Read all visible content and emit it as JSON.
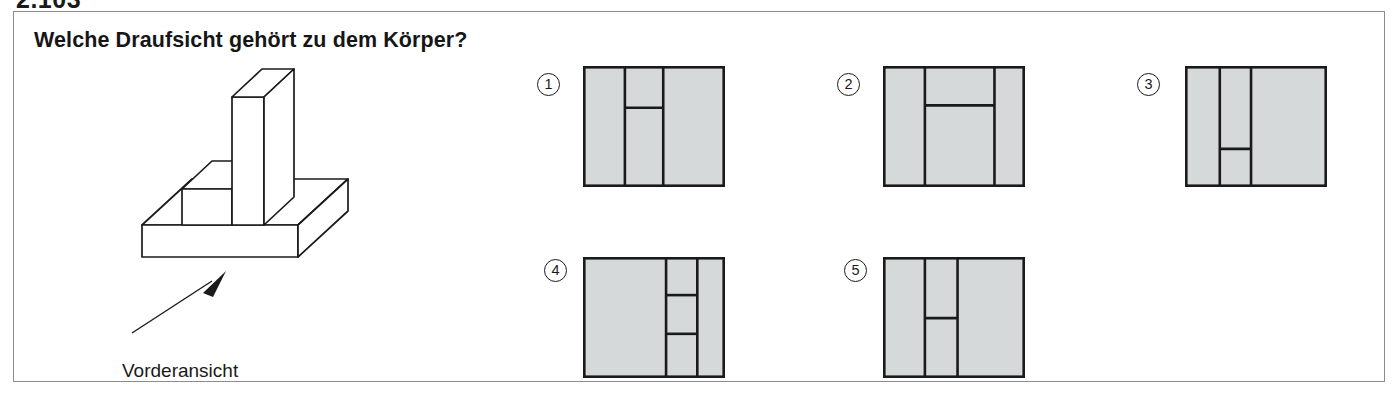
{
  "exercise_number": "2.103",
  "panel": {
    "question": "Welche Draufsicht gehört zu dem Körper?"
  },
  "illustration": {
    "front_view_label": "Vorderansicht",
    "arrow_name": "front-view-arrow",
    "solid_name": "isometric-solid-body"
  },
  "colors": {
    "fill": "#d6d9d9",
    "line": "#1a1a1a",
    "frame": "#8c8c8c",
    "text": "#161616"
  },
  "options": [
    {
      "id": "1",
      "number": "①",
      "circle_x": 536,
      "circle_y": 72,
      "box_x": 582,
      "box_y": 65,
      "box_w": 142,
      "box_h": 121,
      "verticals": [
        0.295,
        0.565
      ],
      "horizontals": [
        {
          "y": 0.345,
          "x1": 0.295,
          "x2": 0.565
        }
      ]
    },
    {
      "id": "2",
      "number": "②",
      "circle_x": 836,
      "circle_y": 72,
      "box_x": 882,
      "box_y": 65,
      "box_w": 142,
      "box_h": 121,
      "verticals": [
        0.295,
        0.785
      ],
      "horizontals": [
        {
          "y": 0.325,
          "x1": 0.295,
          "x2": 0.785
        }
      ]
    },
    {
      "id": "3",
      "number": "③",
      "circle_x": 1136,
      "circle_y": 72,
      "box_x": 1184,
      "box_y": 65,
      "box_w": 142,
      "box_h": 121,
      "verticals": [
        0.245,
        0.465
      ],
      "horizontals": [
        {
          "y": 0.685,
          "x1": 0.245,
          "x2": 0.465
        }
      ]
    },
    {
      "id": "4",
      "number": "④",
      "circle_x": 543,
      "circle_y": 258,
      "box_x": 582,
      "box_y": 256,
      "box_w": 142,
      "box_h": 121,
      "verticals": [
        0.585,
        0.805
      ],
      "horizontals": [
        {
          "y": 0.315,
          "x1": 0.585,
          "x2": 0.805
        },
        {
          "y": 0.635,
          "x1": 0.585,
          "x2": 0.805
        }
      ]
    },
    {
      "id": "5",
      "number": "⑤",
      "circle_x": 843,
      "circle_y": 258,
      "box_x": 882,
      "box_y": 256,
      "box_w": 142,
      "box_h": 121,
      "verticals": [
        0.295,
        0.525
      ],
      "horizontals": [
        {
          "y": 0.505,
          "x1": 0.295,
          "x2": 0.525
        }
      ]
    }
  ]
}
